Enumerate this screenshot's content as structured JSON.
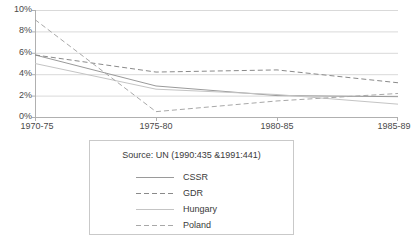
{
  "chart_data": {
    "type": "line",
    "title": "",
    "xlabel": "",
    "ylabel": "",
    "categories": [
      "1970-75",
      "1975-80",
      "1980-85",
      "1985-89"
    ],
    "ylim": [
      0,
      10
    ],
    "ytick_labels": [
      "10%",
      "8%",
      "6%",
      "4%",
      "2%",
      "0%"
    ],
    "ytick_values": [
      10,
      8,
      6,
      4,
      2,
      0
    ],
    "grid": true,
    "legend_position": "below",
    "series": [
      {
        "name": "CSSR",
        "values": [
          5.8,
          2.9,
          2.0,
          1.9
        ],
        "color": "#9a9a9a",
        "style": "solid"
      },
      {
        "name": "GDR",
        "values": [
          5.8,
          4.2,
          4.4,
          3.2
        ],
        "color": "#8a8a8a",
        "style": "dashed"
      },
      {
        "name": "Hungary",
        "values": [
          5.0,
          2.6,
          2.1,
          1.2
        ],
        "color": "#c4c4c4",
        "style": "solid"
      },
      {
        "name": "Poland",
        "values": [
          9.1,
          0.5,
          1.5,
          2.2
        ],
        "color": "#a8a8a8",
        "style": "dashed"
      }
    ]
  },
  "legend": {
    "source_text": "Source: UN (1990:435 &1991:441)",
    "entries": [
      {
        "label": "CSSR"
      },
      {
        "label": "GDR"
      },
      {
        "label": "Hungary"
      },
      {
        "label": "Poland"
      }
    ]
  },
  "colors": {
    "grid": "#d9d9d9",
    "axis": "#b0b0b0",
    "text": "#3a3a3a",
    "legend_border": "#c9c9c9",
    "background": "#ffffff"
  }
}
